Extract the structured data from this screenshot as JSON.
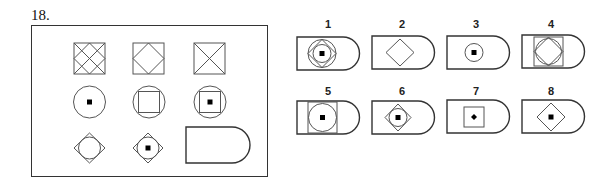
{
  "question": {
    "number": "18.",
    "matrix": {
      "rows": [
        [
          "square with diagonal grid lattice",
          "square with inscribed diamond",
          "square with X diagonals"
        ],
        [
          "circle with center dot",
          "circle with inscribed square",
          "circle with inscribed square and center dot"
        ],
        [
          "diamond with inscribed circle",
          "diamond with inscribed circle and center dot",
          "blank D-shape (answer slot)"
        ]
      ]
    },
    "options": [
      {
        "label": "1",
        "description": "D-shape with circle, diamond, inner circle and center dot"
      },
      {
        "label": "2",
        "description": "D-shape with diamond"
      },
      {
        "label": "3",
        "description": "D-shape with small circle and center dot"
      },
      {
        "label": "4",
        "description": "D-shape with square, diamond and circle"
      },
      {
        "label": "5",
        "description": "D-shape with square, inscribed circle and center dot"
      },
      {
        "label": "6",
        "description": "D-shape with diamond, inscribed circle and center dot"
      },
      {
        "label": "7",
        "description": "D-shape with small square and center dot"
      },
      {
        "label": "8",
        "description": "D-shape with diamond and center dot"
      }
    ]
  },
  "colors": {
    "stroke": "#333333",
    "thin_stroke": "#555555",
    "dot": "#000000"
  }
}
